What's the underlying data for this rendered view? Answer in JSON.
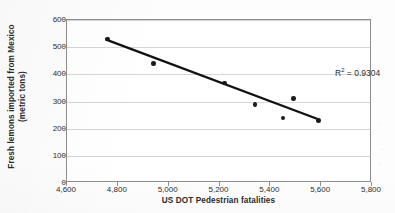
{
  "chart_data": {
    "type": "scatter",
    "title": "",
    "xlabel": "US DOT Pedestrian fatalities",
    "ylabel_line1": "Fresh lemons imported from Mexico",
    "ylabel_line2": "(metric tons)",
    "xlim": [
      4600,
      5800
    ],
    "ylim": [
      0,
      600
    ],
    "xticks": [
      4600,
      4800,
      5000,
      5200,
      5400,
      5600,
      5800
    ],
    "xtick_labels": [
      "4,600",
      "4,800",
      "5,000",
      "5,200",
      "5,400",
      "5,600",
      "5,800"
    ],
    "yticks": [
      0,
      100,
      200,
      300,
      400,
      500,
      600
    ],
    "ytick_labels": [
      "0",
      "100",
      "200",
      "300",
      "400",
      "500",
      "600"
    ],
    "grid": "horizontal",
    "legend": "none",
    "points": [
      {
        "x": 4760,
        "y": 530
      },
      {
        "x": 4940,
        "y": 440
      },
      {
        "x": 5220,
        "y": 368
      },
      {
        "x": 5340,
        "y": 290
      },
      {
        "x": 5490,
        "y": 310
      },
      {
        "x": 5450,
        "y": 240
      },
      {
        "x": 5590,
        "y": 230
      }
    ],
    "trendline": {
      "x_start": 4755,
      "y_start": 527,
      "x_end": 5590,
      "y_end": 232
    },
    "annotations": [
      {
        "name": "r2-label",
        "text_prefix": "R",
        "text_sup": "2",
        "text_suffix": " = 0.9304",
        "full": "R2 = 0.9304"
      }
    ],
    "colors": {
      "marker": "#1a1a1a",
      "trendline": "#111111",
      "gridline": "#d6d6d6",
      "axis": "#8e8e8e",
      "text": "#2d2d2d",
      "background": "#ffffff"
    }
  },
  "specks": [
    "∙",
    "·",
    "∙"
  ]
}
